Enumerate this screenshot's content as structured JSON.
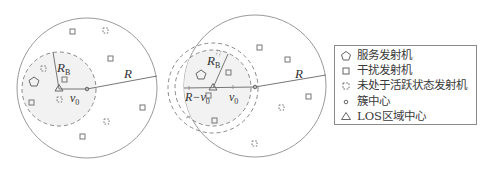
{
  "colors": {
    "stroke": "#8a8a8a",
    "line": "#777777",
    "fill_los": "#f2f2f2",
    "text": "#333333"
  },
  "diagram_left": {
    "cell_radius_label": "R",
    "los_radius_label": "R",
    "los_radius_subscript": "B",
    "offset_label": "v",
    "offset_subscript": "0"
  },
  "diagram_right": {
    "cell_radius_label": "R",
    "los_radius_label": "R",
    "los_radius_subscript": "B",
    "offset_label": "v",
    "offset_subscript": "0",
    "edge_label": "R−v",
    "edge_subscript": "0"
  },
  "legend": {
    "items": [
      {
        "symbol": "pentagon",
        "label": "服务发射机"
      },
      {
        "symbol": "square",
        "label": "干扰发射机"
      },
      {
        "symbol": "dashed-square",
        "label": "未处于活跃状态发射机"
      },
      {
        "symbol": "small-circle",
        "label": "簇中心"
      },
      {
        "symbol": "triangle",
        "label": "LOS区域中心"
      }
    ]
  }
}
